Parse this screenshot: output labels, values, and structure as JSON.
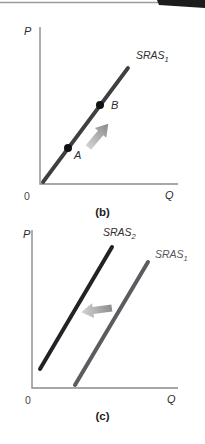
{
  "figure": {
    "type": "economics-supply-diagram",
    "panels": [
      {
        "id": "b",
        "caption": "(b)",
        "axes": {
          "y_label": "P",
          "x_label": "Q",
          "origin_label": "0",
          "color": "#8b8b8b"
        },
        "curves": [
          {
            "base": "SRAS",
            "sub": "1",
            "color": "#3f3f42"
          }
        ],
        "points": [
          {
            "label": "A"
          },
          {
            "label": "B"
          }
        ],
        "arrow": {
          "name": "movement-along-curve",
          "direction": "up-right",
          "color_tail": "#d4d4d4",
          "color_head": "#8a8a8a"
        }
      },
      {
        "id": "c",
        "caption": "(c)",
        "axes": {
          "y_label": "P",
          "x_label": "Q",
          "origin_label": "0",
          "color": "#8b8b8b"
        },
        "curves": [
          {
            "base": "SRAS",
            "sub": "2",
            "color": "#232327"
          },
          {
            "base": "SRAS",
            "sub": "1",
            "color": "#5a5c5f"
          }
        ],
        "points": [],
        "arrow": {
          "name": "leftward-shift",
          "direction": "left",
          "color_tail": "#d4d4d4",
          "color_head": "#8a8a8a"
        }
      }
    ],
    "artifact": {
      "rule_color": "#9b9b9b",
      "block_color": "#1c1c1c"
    },
    "point_color": "#111111"
  }
}
